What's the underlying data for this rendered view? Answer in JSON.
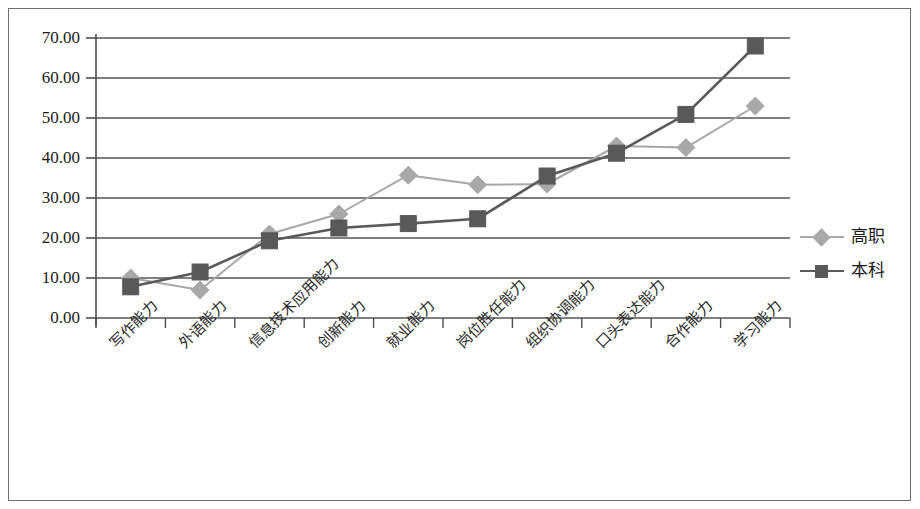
{
  "chart_data": {
    "type": "line",
    "title": "",
    "xlabel": "",
    "ylabel": "",
    "ylim": [
      0,
      70
    ],
    "ytick_step": 10,
    "grid": true,
    "legend_position": "right",
    "categories": [
      "写作能力",
      "外语能力",
      "信息技术应用能力",
      "创新能力",
      "就业能力",
      "岗位胜任能力",
      "组织协调能力",
      "口头表达能力",
      "合作能力",
      "学习能力"
    ],
    "ytick_labels": [
      "70.00",
      "60.00",
      "50.00",
      "40.00",
      "30.00",
      "20.00",
      "10.00",
      "0.00"
    ],
    "ytick_values": [
      70,
      60,
      50,
      40,
      30,
      20,
      10,
      0
    ],
    "series": [
      {
        "name": "高职",
        "marker": "diamond",
        "color": "#a8a8a8",
        "values": [
          10.0,
          7.0,
          21.0,
          26.0,
          35.7,
          33.3,
          33.5,
          43.0,
          42.6,
          53.0
        ]
      },
      {
        "name": "本科",
        "marker": "square",
        "color": "#595959",
        "values": [
          7.8,
          11.5,
          19.3,
          22.5,
          23.6,
          24.8,
          35.5,
          41.2,
          50.9,
          68.0
        ]
      }
    ]
  },
  "legend": {
    "items": [
      {
        "label": "高职",
        "marker": "diamond",
        "color": "#a8a8a8"
      },
      {
        "label": "本科",
        "marker": "square",
        "color": "#595959"
      }
    ]
  },
  "axes": {
    "axis_color": "#4d4d4d",
    "grid_color": "#555555"
  }
}
